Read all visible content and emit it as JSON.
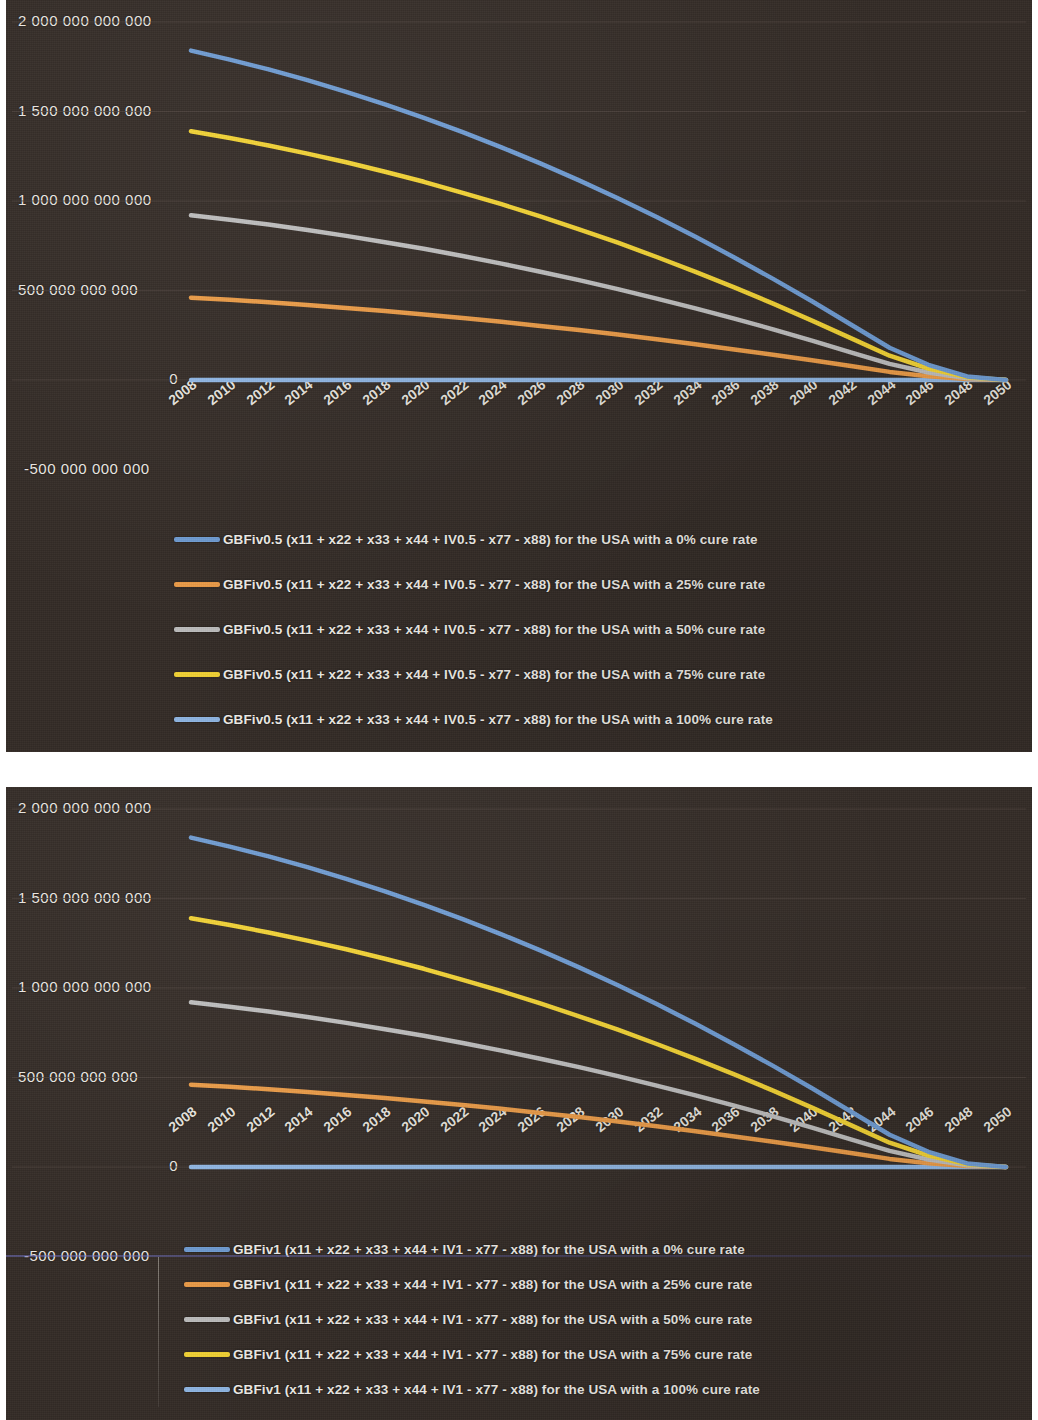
{
  "document": {
    "kind": "scanned-figure-page",
    "background_color": "#ffffff",
    "panel_background_color": "#332b26"
  },
  "palette": {
    "series_0": "#6e9bd2",
    "series_25": "#eb9b46",
    "series_50": "#bdbdbd",
    "series_75": "#f2d233",
    "series_100": "#8fb6e3",
    "axis_text": "#ede9e3",
    "gridline": "#4a403a"
  },
  "charts": [
    {
      "id": "chart-top",
      "chart_data": {
        "type": "line",
        "title": "",
        "subtitle": "",
        "xlabel": "",
        "ylabel": "",
        "grid": true,
        "legend_position": "bottom",
        "xlim": [
          2008,
          2050
        ],
        "ylim": [
          -500000000000,
          2000000000000
        ],
        "y_ticks": [
          "2 000 000 000 000",
          "1 500 000 000 000",
          "1 000 000 000 000",
          "500 000 000 000",
          "0",
          "-500 000 000 000"
        ],
        "y_tick_values": [
          2000000000000,
          1500000000000,
          1000000000000,
          500000000000,
          0,
          -500000000000
        ],
        "x_ticks": [
          "2008",
          "2010",
          "2012",
          "2014",
          "2016",
          "2018",
          "2020",
          "2022",
          "2024",
          "2026",
          "2028",
          "2030",
          "2032",
          "2034",
          "2036",
          "2038",
          "2040",
          "2042",
          "2044",
          "2046",
          "2048",
          "2050"
        ],
        "x": [
          2008,
          2010,
          2012,
          2014,
          2016,
          2018,
          2020,
          2022,
          2024,
          2026,
          2028,
          2030,
          2032,
          2034,
          2036,
          2038,
          2040,
          2042,
          2044,
          2046,
          2048,
          2050
        ],
        "series": [
          {
            "name": "GBFiv0.5 (x11 + x22 + x33 + x44 + IV0.5 - x77 - x88) for the USA with a 0% cure rate",
            "color": "#6e9bd2",
            "values": [
              1840000000000,
              1790000000000,
              1735000000000,
              1675000000000,
              1610000000000,
              1540000000000,
              1465000000000,
              1385000000000,
              1300000000000,
              1210000000000,
              1115000000000,
              1015000000000,
              910000000000,
              800000000000,
              685000000000,
              565000000000,
              440000000000,
              310000000000,
              180000000000,
              85000000000,
              20000000000,
              0
            ]
          },
          {
            "name": "GBFiv0.5 (x11 + x22 + x33 + x44 + IV0.5 - x77 - x88) for the USA with a 25% cure rate",
            "color": "#eb9b46",
            "values": [
              460000000000,
              448000000000,
              434000000000,
              419000000000,
              403000000000,
              385000000000,
              366000000000,
              346000000000,
              325000000000,
              302000000000,
              279000000000,
              254000000000,
              228000000000,
              200000000000,
              171000000000,
              141000000000,
              110000000000,
              78000000000,
              45000000000,
              21000000000,
              5000000000,
              0
            ]
          },
          {
            "name": "GBFiv0.5 (x11 + x22 + x33 + x44 + IV0.5 - x77 - x88) for the USA with a 50% cure rate",
            "color": "#bdbdbd",
            "values": [
              920000000000,
              895000000000,
              868000000000,
              838000000000,
              805000000000,
              770000000000,
              733000000000,
              693000000000,
              650000000000,
              605000000000,
              558000000000,
              508000000000,
              455000000000,
              400000000000,
              343000000000,
              283000000000,
              220000000000,
              155000000000,
              90000000000,
              42000000000,
              10000000000,
              0
            ]
          },
          {
            "name": "GBFiv0.5 (x11 + x22 + x33 + x44 + IV0.5 - x77 - x88) for the USA with a 75% cure rate",
            "color": "#f2d233",
            "values": [
              1390000000000,
              1352000000000,
              1310000000000,
              1265000000000,
              1216000000000,
              1163000000000,
              1107000000000,
              1046000000000,
              982000000000,
              914000000000,
              842000000000,
              767000000000,
              687000000000,
              604000000000,
              518000000000,
              427000000000,
              332000000000,
              234000000000,
              136000000000,
              64000000000,
              15000000000,
              0
            ]
          },
          {
            "name": "GBFiv0.5 (x11 + x22 + x33 + x44 + IV0.5 - x77 - x88) for the USA with a 100% cure rate",
            "color": "#8fb6e3",
            "values": [
              0,
              0,
              0,
              0,
              0,
              0,
              0,
              0,
              0,
              0,
              0,
              0,
              0,
              0,
              0,
              0,
              0,
              0,
              0,
              0,
              0,
              0
            ]
          }
        ]
      }
    },
    {
      "id": "chart-bottom",
      "chart_data": {
        "type": "line",
        "title": "",
        "subtitle": "",
        "xlabel": "",
        "ylabel": "",
        "grid": true,
        "legend_position": "bottom",
        "xlim": [
          2008,
          2050
        ],
        "ylim": [
          -500000000000,
          2000000000000
        ],
        "y_ticks": [
          "2 000 000 000 000",
          "1 500 000 000 000",
          "1 000 000 000 000",
          "500 000 000 000",
          "0",
          "-500 000 000 000"
        ],
        "y_tick_values": [
          2000000000000,
          1500000000000,
          1000000000000,
          500000000000,
          0,
          -500000000000
        ],
        "x_ticks": [
          "2008",
          "2010",
          "2012",
          "2014",
          "2016",
          "2018",
          "2020",
          "2022",
          "2024",
          "2026",
          "2028",
          "2030",
          "2032",
          "2034",
          "2036",
          "2038",
          "2040",
          "2042",
          "2044",
          "2046",
          "2048",
          "2050"
        ],
        "x": [
          2008,
          2010,
          2012,
          2014,
          2016,
          2018,
          2020,
          2022,
          2024,
          2026,
          2028,
          2030,
          2032,
          2034,
          2036,
          2038,
          2040,
          2042,
          2044,
          2046,
          2048,
          2050
        ],
        "series": [
          {
            "name": "GBFiv1 (x11 + x22 + x33 + x44 + IV1 - x77 - x88) for the USA with a 0% cure rate",
            "color": "#6e9bd2",
            "values": [
              1840000000000,
              1790000000000,
              1735000000000,
              1675000000000,
              1610000000000,
              1540000000000,
              1465000000000,
              1385000000000,
              1300000000000,
              1210000000000,
              1115000000000,
              1015000000000,
              910000000000,
              800000000000,
              685000000000,
              565000000000,
              440000000000,
              310000000000,
              180000000000,
              85000000000,
              20000000000,
              0
            ]
          },
          {
            "name": "GBFiv1 (x11 + x22 + x33 + x44 + IV1 - x77 - x88) for the USA with a 25% cure rate",
            "color": "#eb9b46",
            "values": [
              460000000000,
              448000000000,
              434000000000,
              419000000000,
              403000000000,
              385000000000,
              366000000000,
              346000000000,
              325000000000,
              302000000000,
              279000000000,
              254000000000,
              228000000000,
              200000000000,
              171000000000,
              141000000000,
              110000000000,
              78000000000,
              45000000000,
              21000000000,
              5000000000,
              0
            ]
          },
          {
            "name": "GBFiv1 (x11 + x22 + x33 + x44 + IV1 - x77 - x88) for the USA with a 50% cure rate",
            "color": "#bdbdbd",
            "values": [
              920000000000,
              895000000000,
              868000000000,
              838000000000,
              805000000000,
              770000000000,
              733000000000,
              693000000000,
              650000000000,
              605000000000,
              558000000000,
              508000000000,
              455000000000,
              400000000000,
              343000000000,
              283000000000,
              220000000000,
              155000000000,
              90000000000,
              42000000000,
              10000000000,
              0
            ]
          },
          {
            "name": "GBFiv1 (x11 + x22 + x33 + x44 + IV1 - x77 - x88) for the USA with a 75% cure rate",
            "color": "#f2d233",
            "values": [
              1390000000000,
              1352000000000,
              1310000000000,
              1265000000000,
              1216000000000,
              1163000000000,
              1107000000000,
              1046000000000,
              982000000000,
              914000000000,
              842000000000,
              767000000000,
              687000000000,
              604000000000,
              518000000000,
              427000000000,
              332000000000,
              234000000000,
              136000000000,
              64000000000,
              15000000000,
              0
            ]
          },
          {
            "name": "GBFiv1 (x11 + x22 + x33 + x44 + IV1 - x77 - x88) for the USA with a 100% cure rate",
            "color": "#8fb6e3",
            "values": [
              0,
              0,
              0,
              0,
              0,
              0,
              0,
              0,
              0,
              0,
              0,
              0,
              0,
              0,
              0,
              0,
              0,
              0,
              0,
              0,
              0,
              0
            ]
          }
        ]
      }
    }
  ]
}
